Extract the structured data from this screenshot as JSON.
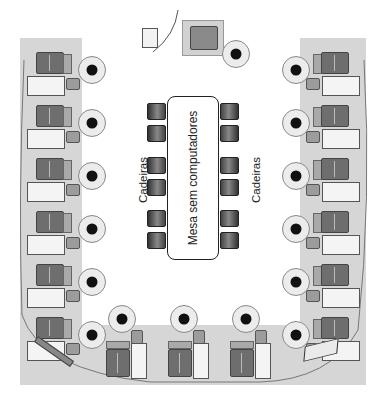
{
  "diagram": {
    "type": "computer-lab-layout",
    "central_table": {
      "label": "Mesa sem computadores"
    },
    "chair_labels": {
      "left": "Cadeiras",
      "right": "Cadeiras"
    },
    "stations": {
      "left_column_count": 6,
      "right_column_count": 6,
      "bottom_row_count": 3,
      "total": 15
    },
    "peripherals": {
      "top": [
        "printer",
        "instructor-station",
        "ups-device"
      ],
      "bottom_left": "wall-outlet-strip",
      "bottom_right": "scanner"
    },
    "chairs_per_side": 6,
    "colors": {
      "desk": "#d6d6d6",
      "monitor": "#6e6e6e",
      "background": "#ffffff"
    }
  }
}
